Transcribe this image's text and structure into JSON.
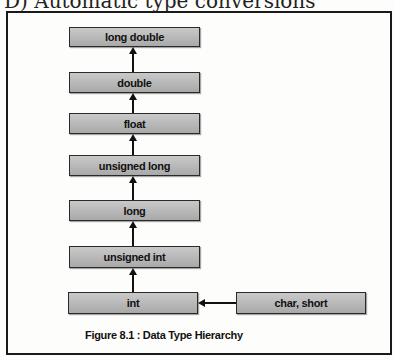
{
  "heading": "D) Automatic type conversions",
  "diagram": {
    "nodes": [
      {
        "id": "long-double",
        "label": "long double"
      },
      {
        "id": "double",
        "label": "double"
      },
      {
        "id": "float",
        "label": "float"
      },
      {
        "id": "unsigned-long",
        "label": "unsigned long"
      },
      {
        "id": "long",
        "label": "long"
      },
      {
        "id": "unsigned-int",
        "label": "unsigned int"
      },
      {
        "id": "int",
        "label": "int"
      },
      {
        "id": "char-short",
        "label": "char, short"
      }
    ],
    "edges": [
      {
        "from": "char-short",
        "to": "int"
      },
      {
        "from": "int",
        "to": "unsigned-int"
      },
      {
        "from": "unsigned-int",
        "to": "long"
      },
      {
        "from": "long",
        "to": "unsigned-long"
      },
      {
        "from": "unsigned-long",
        "to": "float"
      },
      {
        "from": "float",
        "to": "double"
      },
      {
        "from": "double",
        "to": "long-double"
      }
    ],
    "caption": "Figure 8.1 : Data Type Hierarchy"
  },
  "colors": {
    "box_fill": "#b9b9b9",
    "box_border": "#2a2a2a",
    "frame": "#1a1a1a"
  }
}
